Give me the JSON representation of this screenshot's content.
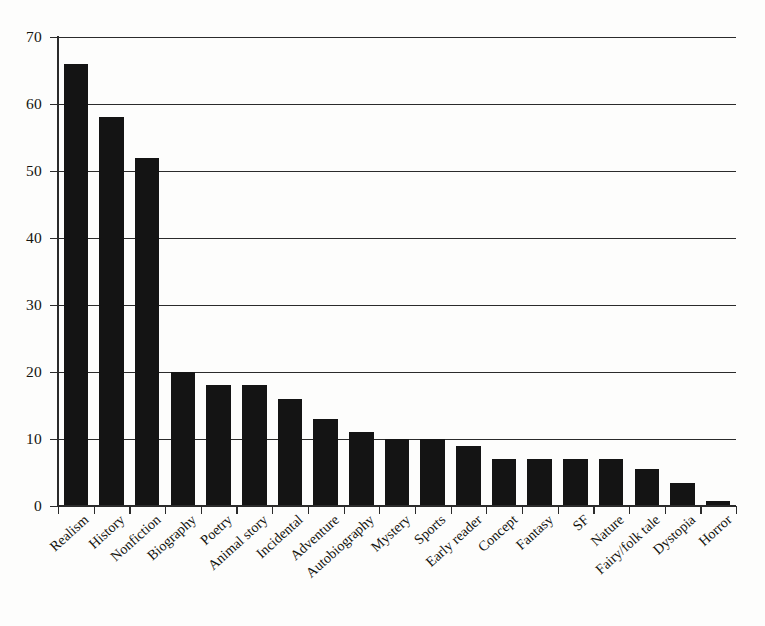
{
  "figure": {
    "background_color": "#fdfdfc",
    "bar_color": "#141414",
    "axis_color": "#2b2b2b",
    "text_color": "#14140f"
  },
  "axes": {
    "y_tick_labels": [
      "0",
      "10",
      "20",
      "30",
      "40",
      "50",
      "60",
      "70"
    ],
    "y_min": 0,
    "y_max": 70,
    "y_step": 10
  },
  "chart_data": {
    "type": "bar",
    "title": "",
    "subtitle": "",
    "xlabel": "",
    "ylabel": "",
    "ylim": [
      0,
      70
    ],
    "ytick_values": [
      0,
      10,
      20,
      30,
      40,
      50,
      60,
      70
    ],
    "grid": true,
    "grid_axis": "y",
    "legend": false,
    "legend_position": "none",
    "orientation": "vertical",
    "bar_color": "#141414",
    "xtick_label_rotation": -42,
    "categories": [
      "Realism",
      "History",
      "Nonfiction",
      "Biography",
      "Poetry",
      "Animal story",
      "Incidental",
      "Adventure",
      "Autobiography",
      "Mystery",
      "Sports",
      "Early reader",
      "Concept",
      "Fantasy",
      "SF",
      "Nature",
      "Fairy/folk tale",
      "Dystopia",
      "Horror"
    ],
    "values": [
      66,
      58,
      52,
      20,
      18,
      18,
      16,
      13,
      11,
      10,
      10,
      9,
      7,
      7,
      7,
      7,
      5.5,
      3.5,
      0.7
    ]
  }
}
